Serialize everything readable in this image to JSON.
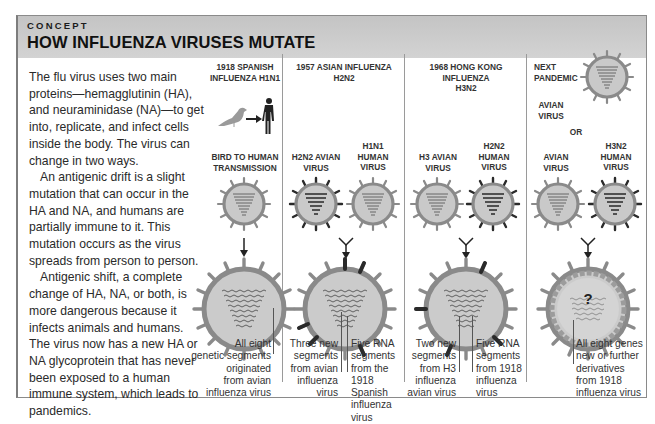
{
  "header": {
    "kicker": "CONCEPT",
    "title": "HOW INFLUENZA VIRUSES MUTATE"
  },
  "intro": {
    "paragraphs": [
      "The flu virus uses two main proteins—hemagglutinin (HA), and neuraminidase (NA)—to get into, replicate, and infect cells inside the body. The virus can change in two ways.",
      "An antigenic drift is a slight mutation that can occur in the HA and NA, and humans are partially immune to it. This mutation occurs as the virus spreads from person to person.",
      "Antigenic shift, a complete change of HA, NA, or both, is more dangerous because it infects animals and humans. The virus now has a new HA or NA glycoprotein that has never been exposed to a human immune system, which leads to pandemics."
    ]
  },
  "columns": [
    {
      "title_line1": "1918 SPANISH",
      "title_line2": "INFLUENZA H1N1",
      "transmission_label_1": "BIRD TO HUMAN",
      "transmission_label_2": "TRANSMISSION",
      "icons": [
        "bird-icon",
        "arrow-right-icon",
        "human-icon"
      ],
      "caption": [
        "All eight",
        "genetic segments",
        "originated",
        "from avian",
        "influenza virus"
      ]
    },
    {
      "title_line1": "1957 ASIAN INFLUENZA",
      "title_line2": "H2N2",
      "source_a": [
        "H2N2 AVIAN",
        "VIRUS"
      ],
      "source_b": [
        "H1N1",
        "HUMAN",
        "VIRUS"
      ],
      "caption_left": [
        "Three new",
        "segments",
        "from avian",
        "influenza",
        "virus"
      ],
      "caption_right": [
        "Five RNA",
        "segments",
        "from the",
        "1918 Spanish",
        "influenza virus"
      ]
    },
    {
      "title_line1": "1968 HONG KONG INFLUENZA",
      "title_line2": "H3N2",
      "source_a": [
        "H3 AVIAN",
        "VIRUS"
      ],
      "source_b": [
        "H2N2",
        "HUMAN",
        "VIRUS"
      ],
      "caption_left": [
        "Two new",
        "segments",
        "from H3",
        "influenza",
        "avian virus"
      ],
      "caption_right": [
        "Five RNA",
        "segments",
        "from 1918",
        "influenza",
        "virus"
      ]
    },
    {
      "title_line1": "NEXT",
      "title_line2": "PANDEMIC",
      "option_1": [
        "AVIAN",
        "VIRUS"
      ],
      "or_label": "OR",
      "source_a": [
        "AVIAN",
        "VIRUS"
      ],
      "source_b": [
        "H3N2",
        "HUMAN",
        "VIRUS"
      ],
      "unknown_mark": "?",
      "caption": [
        "All eight genes",
        "new or further",
        "derivatives",
        "from 1918",
        "influenza virus"
      ]
    }
  ],
  "colors": {
    "header_band": "#c9c9c9",
    "virus_shell": "#8a8a8a",
    "virus_fill": "#c8c8c8",
    "dark_spike": "#2a2a2a",
    "frame_border": "#8a8a8a"
  }
}
